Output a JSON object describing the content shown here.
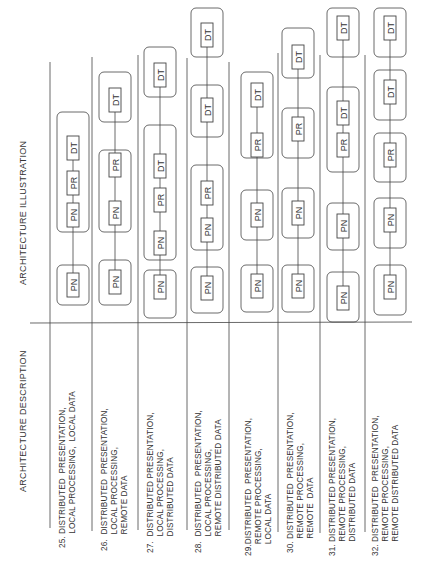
{
  "headers": {
    "description": "ARCHITECTURE DESCRIPTION",
    "illustration": "ARCHITECTURE ILLUSTRATION"
  },
  "node_labels": {
    "PN": "PN",
    "PR": "PR",
    "DT": "DT"
  },
  "rows": [
    {
      "number": "25.",
      "description": "25. DISTRIBUTED  PRESENTATION,\n      LOCAL PROCESSING,  LOCAL DATA",
      "groups": [
        [
          "PN"
        ],
        [
          "PN",
          "PR",
          "DT"
        ]
      ]
    },
    {
      "number": "26.",
      "description": "26.  DISTRIBUTED  PRESENTATION,\n       LOCAL PROCESSING,\n       REMOTE DATA",
      "groups": [
        [
          "PN"
        ],
        [
          "PN",
          "PR"
        ],
        [
          "DT"
        ]
      ]
    },
    {
      "number": "27.",
      "description": "27.  DISTRIBUTED PRESENTATION,\n       LOCAL PROCESSING,\n       DISTRIBUTED DATA",
      "groups": [
        [
          "PN"
        ],
        [
          "PN",
          "PR",
          "DT"
        ],
        [
          "DT"
        ]
      ]
    },
    {
      "number": "28.",
      "description": "28.  DISTRIBUTED  PRESENTATION,\n       LOCAL PROCESSING,\n       REMOTE DISTRIBUTED DATA",
      "groups": [
        [
          "PN"
        ],
        [
          "PN",
          "PR"
        ],
        [
          "DT"
        ],
        [
          "DT"
        ]
      ]
    },
    {
      "number": "29.",
      "description": "29.DISTRIBUTED  PRESENTATION,\n     REMOTE PROCESSING,\n     LOCAL DATA",
      "groups": [
        [
          "PN"
        ],
        [
          "PN"
        ],
        [
          "PR",
          "DT"
        ]
      ]
    },
    {
      "number": "30.",
      "description": "30. DISTRIBUTED  PRESENTATION,\n      REMOTE PROCESSING,\n      REMOTE  DATA",
      "groups": [
        [
          "PN"
        ],
        [
          "PN"
        ],
        [
          "PR"
        ],
        [
          "DT"
        ]
      ]
    },
    {
      "number": "31.",
      "description": "31. DISTRIBUTED PRESENTATION,\n      REMOTE PROCESSING,\n      DISTRIBUTED DATA",
      "groups": [
        [
          "PN"
        ],
        [
          "PN"
        ],
        [
          "PR",
          "DT"
        ],
        [
          "DT"
        ]
      ]
    },
    {
      "number": "32.",
      "description": "32. DISTRIBUTED  PRESENTATION,\n      REMOTE PROCESSING,\n      REMOTE DISTRIBUTED DATA",
      "groups": [
        [
          "PN"
        ],
        [
          "PN"
        ],
        [
          "PR"
        ],
        [
          "DT"
        ],
        [
          "DT"
        ]
      ]
    }
  ]
}
